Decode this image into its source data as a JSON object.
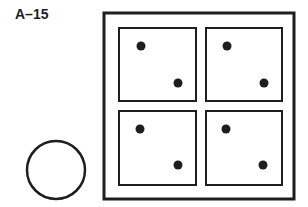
{
  "figure": {
    "label": "A–15",
    "colors": {
      "stroke": "#1e1e1e",
      "background": "#ffffff"
    },
    "outer_frame": {
      "x": 104,
      "y": 13,
      "w": 190,
      "h": 186,
      "stroke_width": 3
    },
    "panels": [
      {
        "id": "top-left",
        "x": 119,
        "y": 28,
        "w": 77,
        "h": 73,
        "dots": [
          [
            141,
            46
          ],
          [
            178,
            83
          ]
        ]
      },
      {
        "id": "top-right",
        "x": 206,
        "y": 28,
        "w": 76,
        "h": 73,
        "dots": [
          [
            227,
            46
          ],
          [
            264,
            83
          ]
        ]
      },
      {
        "id": "bottom-left",
        "x": 119,
        "y": 111,
        "w": 77,
        "h": 74,
        "dots": [
          [
            140,
            129
          ],
          [
            178,
            165
          ]
        ]
      },
      {
        "id": "bottom-right",
        "x": 206,
        "y": 111,
        "w": 76,
        "h": 74,
        "dots": [
          [
            226,
            129
          ],
          [
            263,
            165
          ]
        ]
      }
    ],
    "answer_option": {
      "shape": "circle",
      "cx": 56,
      "cy": 170,
      "r": 29
    }
  }
}
